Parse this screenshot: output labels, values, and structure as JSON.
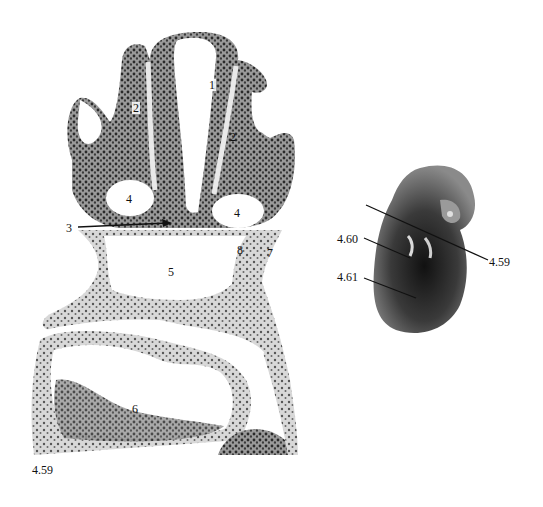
{
  "figure": {
    "caption": "4.59",
    "section_labels": {
      "l1": "1",
      "l2a": "2",
      "l2b": "2",
      "l3": "3",
      "l4a": "4",
      "l4b": "4",
      "l5": "5",
      "l6": "6",
      "l7": "7",
      "l8": "8"
    },
    "embryo_labels": {
      "plane_459": "4.59",
      "plane_460": "4.60",
      "plane_461": "4.61"
    }
  }
}
